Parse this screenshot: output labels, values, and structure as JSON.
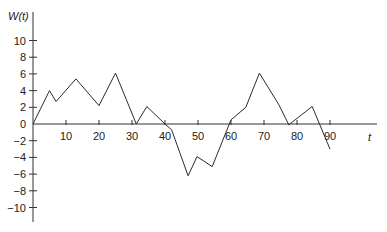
{
  "chart_data": {
    "type": "line",
    "title": "",
    "xlabel": "t",
    "ylabel": "W(t)",
    "xlim": [
      0,
      95
    ],
    "ylim": [
      -11,
      12
    ],
    "grid": false,
    "legend": null,
    "x_ticks": [
      10,
      20,
      30,
      40,
      50,
      60,
      70,
      80,
      90
    ],
    "x_tick_labels": [
      "10",
      "20",
      "30",
      "40",
      "50",
      "60",
      "70",
      "80",
      "90"
    ],
    "y_ticks": [
      10,
      8,
      6,
      4,
      2,
      0,
      -2,
      -4,
      -6,
      -8,
      -10
    ],
    "y_tick_labels": [
      "10",
      "8",
      "6",
      "4",
      "2",
      "0",
      "−2",
      "−4",
      "−6",
      "−8",
      "−10"
    ],
    "series": [
      {
        "name": "W(t)",
        "color": "#2b2b2b",
        "x": [
          0,
          5,
          7,
          13,
          20,
          25,
          31.3,
          34.5,
          40,
          42,
          47,
          49.7,
          54.3,
          59.5,
          60,
          64.5,
          68.6,
          74.5,
          77.5,
          84.6,
          90
        ],
        "y": [
          0,
          4,
          2.7,
          5.4,
          2.2,
          6.1,
          0,
          2.1,
          0,
          -0.7,
          -6.2,
          -3.9,
          -5.1,
          0,
          0.5,
          2.0,
          6.1,
          2.3,
          -0.1,
          2.1,
          -3.0
        ]
      }
    ]
  },
  "labels": {
    "y_axis": "W(t)",
    "x_axis": "t"
  }
}
